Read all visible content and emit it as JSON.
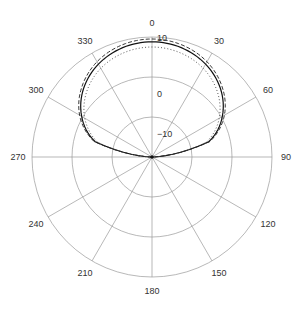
{
  "chart_data": {
    "type": "polar-line",
    "title": "",
    "angular_axis": {
      "unit": "degrees",
      "direction": "clockwise",
      "zero_at": "top",
      "tick_labels": [
        "0",
        "30",
        "60",
        "90",
        "120",
        "150",
        "180",
        "210",
        "240",
        "270",
        "300",
        "330"
      ],
      "spoke_step": 30
    },
    "radial_axis": {
      "unit": "dB",
      "range": [
        -20,
        10
      ],
      "tick_labels": [
        "10",
        "0",
        "-10"
      ],
      "tick_values": [
        10,
        0,
        -10
      ],
      "label_angle": 0
    },
    "theta": [
      -90,
      -75,
      -60,
      -45,
      -30,
      -15,
      0,
      15,
      30,
      45,
      60,
      75,
      90
    ],
    "series": [
      {
        "name": "solid",
        "style": "solid",
        "color": "#111111",
        "values": [
          -20,
          -5.3,
          0.3,
          4.2,
          6.8,
          8.3,
          8.8,
          8.3,
          6.8,
          4.2,
          0.3,
          -5.3,
          -20
        ]
      },
      {
        "name": "dashed",
        "style": "dashed",
        "color": "#222222",
        "values": [
          -20,
          -5.0,
          0.9,
          4.8,
          7.5,
          9.0,
          9.5,
          9.0,
          7.5,
          4.8,
          0.9,
          -5.0,
          -20
        ]
      },
      {
        "name": "dotted",
        "style": "dotted",
        "color": "#444444",
        "values": [
          -20,
          -6.0,
          -0.6,
          3.1,
          5.6,
          7.0,
          7.5,
          7.0,
          5.6,
          3.1,
          -0.6,
          -6.0,
          -20
        ]
      }
    ],
    "grid": true,
    "legend": null
  }
}
